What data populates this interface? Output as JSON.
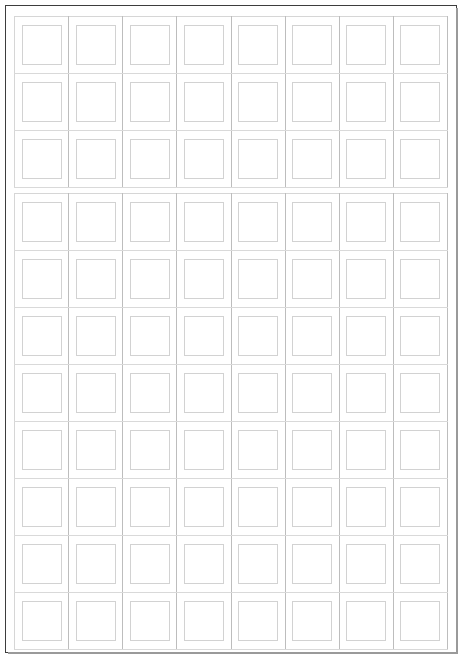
{
  "document": {
    "title": "Blank Grid Form",
    "page_border_color": "#3d3d3d",
    "grid_line_color": "#cfcfcf",
    "box_line_color": "#d2d2d2",
    "background_color": "#ffffff"
  },
  "tables": [
    {
      "name": "top-grid",
      "columns": 8,
      "rows": 3,
      "cells": [
        [
          "",
          "",
          "",
          "",
          "",
          "",
          "",
          ""
        ],
        [
          "",
          "",
          "",
          "",
          "",
          "",
          "",
          ""
        ],
        [
          "",
          "",
          "",
          "",
          "",
          "",
          "",
          ""
        ]
      ]
    },
    {
      "name": "bottom-grid",
      "columns": 8,
      "rows": 8,
      "cells": [
        [
          "",
          "",
          "",
          "",
          "",
          "",
          "",
          ""
        ],
        [
          "",
          "",
          "",
          "",
          "",
          "",
          "",
          ""
        ],
        [
          "",
          "",
          "",
          "",
          "",
          "",
          "",
          ""
        ],
        [
          "",
          "",
          "",
          "",
          "",
          "",
          "",
          ""
        ],
        [
          "",
          "",
          "",
          "",
          "",
          "",
          "",
          ""
        ],
        [
          "",
          "",
          "",
          "",
          "",
          "",
          "",
          ""
        ],
        [
          "",
          "",
          "",
          "",
          "",
          "",
          "",
          ""
        ],
        [
          "",
          "",
          "",
          "",
          "",
          "",
          "",
          ""
        ]
      ]
    }
  ]
}
